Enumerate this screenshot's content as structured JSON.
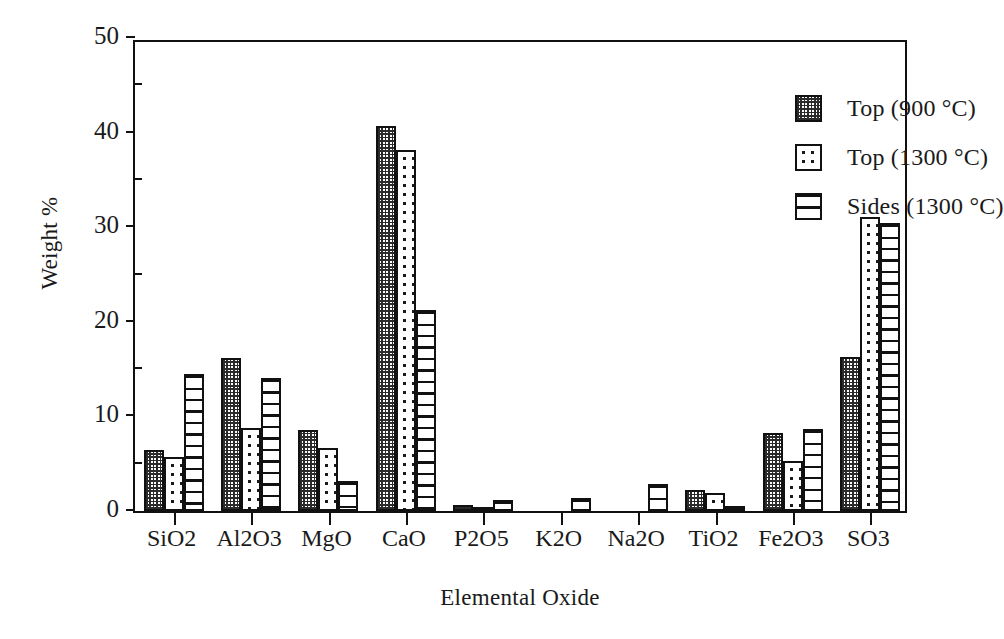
{
  "chart_data": {
    "type": "bar",
    "title": "",
    "xlabel": "Elemental Oxide",
    "ylabel": "Weight %",
    "ylim": [
      0,
      50
    ],
    "yticks": [
      0,
      10,
      20,
      30,
      40,
      50
    ],
    "grid": false,
    "legend_position": "top-right",
    "categories": [
      "SiO2",
      "Al2O3",
      "MgO",
      "CaO",
      "P2O5",
      "K2O",
      "Na2O",
      "TiO2",
      "Fe2O3",
      "SO3"
    ],
    "series": [
      {
        "name": "Top (900 °C)",
        "pattern": "cross-hatch",
        "values": [
          6.4,
          16.2,
          8.6,
          40.7,
          0.6,
          0.0,
          0.0,
          2.2,
          8.2,
          16.3
        ]
      },
      {
        "name": "Top (1300 °C)",
        "pattern": "dots",
        "values": [
          5.7,
          8.8,
          6.7,
          38.2,
          0.15,
          0.0,
          0.0,
          1.9,
          5.3,
          31.1
        ]
      },
      {
        "name": "Sides (1300 °C)",
        "pattern": "horizontal-lines",
        "values": [
          14.5,
          14.1,
          3.2,
          21.2,
          1.2,
          1.4,
          2.9,
          0.5,
          8.7,
          30.4
        ]
      }
    ]
  },
  "axes": {
    "y_tick_labels": [
      "0",
      "10",
      "20",
      "30",
      "40",
      "50"
    ],
    "y_axis_title": "Weight %",
    "x_axis_title": "Elemental Oxide",
    "x_tick_labels": [
      "SiO2",
      "Al2O3",
      "MgO",
      "CaO",
      "P2O5",
      "K2O",
      "Na2O",
      "TiO2",
      "Fe2O3",
      "SO3"
    ]
  },
  "legend": {
    "items": [
      {
        "label": "Top (900 °C)",
        "pattern": "cross-hatch"
      },
      {
        "label": "Top (1300 °C)",
        "pattern": "dots"
      },
      {
        "label": "Sides (1300 °C)",
        "pattern": "horizontal-lines"
      }
    ]
  },
  "colors": {
    "ink": "#111111",
    "background": "#ffffff",
    "hatch": "#2b2b2b"
  }
}
